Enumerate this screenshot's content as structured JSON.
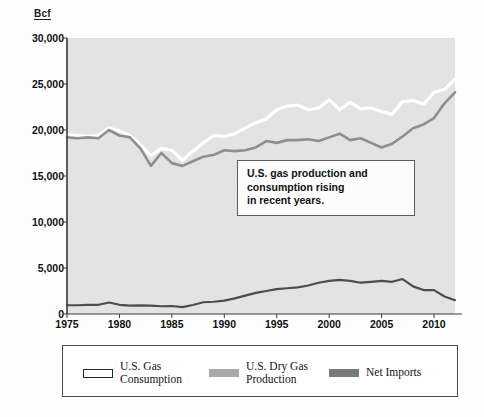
{
  "chart_data": {
    "type": "line",
    "title": "",
    "subtitle": "",
    "xlabel": "",
    "ylabel": "Bcf",
    "ylim": [
      0,
      30000
    ],
    "xlim": [
      1975,
      2012
    ],
    "grid": false,
    "legend_position": "bottom",
    "y_tick_labels": [
      "30,000",
      "25,000",
      "20,000",
      "15,000",
      "10,000",
      "5,000",
      "0"
    ],
    "y_tick_values": [
      30000,
      25000,
      20000,
      15000,
      10000,
      5000,
      0
    ],
    "x_tick_labels": [
      "1975",
      "1980",
      "1985",
      "1990",
      "1995",
      "2000",
      "2005",
      "2010"
    ],
    "x_tick_values": [
      1975,
      1980,
      1985,
      1990,
      1995,
      2000,
      2005,
      2010
    ],
    "x": [
      1975,
      1976,
      1977,
      1978,
      1979,
      1980,
      1981,
      1982,
      1983,
      1984,
      1985,
      1986,
      1987,
      1988,
      1989,
      1990,
      1991,
      1992,
      1993,
      1994,
      1995,
      1996,
      1997,
      1998,
      1999,
      2000,
      2001,
      2002,
      2003,
      2004,
      2005,
      2006,
      2007,
      2008,
      2009,
      2010,
      2011,
      2012
    ],
    "series": [
      {
        "name": "U.S. Gas Consumption",
        "color": "#ffffff",
        "values": [
          19500,
          19400,
          19300,
          19400,
          20200,
          19900,
          19400,
          18400,
          17200,
          18000,
          17800,
          16700,
          17700,
          18600,
          19400,
          19300,
          19600,
          20200,
          20800,
          21200,
          22200,
          22600,
          22700,
          22200,
          22400,
          23300,
          22200,
          23000,
          22300,
          22400,
          22000,
          21700,
          23100,
          23200,
          22800,
          24100,
          24400,
          25500
        ]
      },
      {
        "name": "U.S. Dry Gas Production",
        "color": "#8e8e8e",
        "values": [
          19200,
          19100,
          19200,
          19100,
          20000,
          19400,
          19200,
          18000,
          16100,
          17500,
          16400,
          16100,
          16600,
          17100,
          17300,
          17800,
          17700,
          17800,
          18100,
          18800,
          18600,
          18900,
          18900,
          19000,
          18800,
          19200,
          19600,
          18900,
          19100,
          18600,
          18100,
          18500,
          19300,
          20200,
          20600,
          21300,
          22900,
          24100
        ]
      },
      {
        "name": "Net Imports",
        "color": "#4d4d4d",
        "values": [
          950,
          950,
          1000,
          1000,
          1250,
          1000,
          900,
          930,
          900,
          840,
          870,
          740,
          980,
          1280,
          1330,
          1450,
          1700,
          2000,
          2300,
          2500,
          2700,
          2800,
          2900,
          3100,
          3400,
          3600,
          3700,
          3600,
          3400,
          3500,
          3600,
          3500,
          3800,
          3000,
          2600,
          2600,
          1900,
          1500
        ]
      }
    ],
    "annotation": {
      "lines": [
        "U.S. gas production and",
        "consumption rising",
        "in recent years."
      ]
    }
  },
  "legend": {
    "entries": [
      {
        "label": "U.S. Gas\nConsumption",
        "swatch": "white"
      },
      {
        "label": "U.S. Dry Gas\nProduction",
        "swatch": "light-gray"
      },
      {
        "label": "Net Imports",
        "swatch": "dark-gray"
      }
    ]
  },
  "axis": {
    "y_unit": "Bcf"
  }
}
